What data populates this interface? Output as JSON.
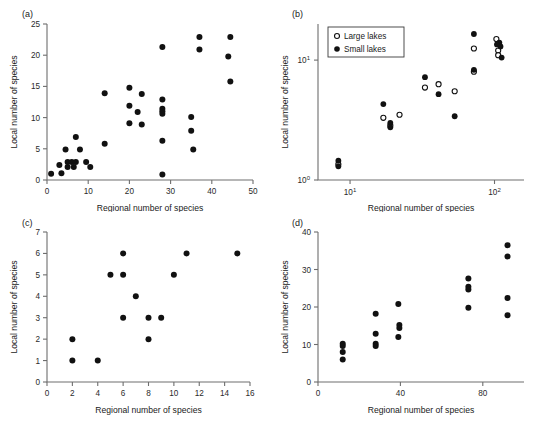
{
  "figure": {
    "axis_titles": {
      "x": "Regional number of species",
      "y": "Local number of species"
    }
  },
  "chart_data": [
    {
      "type": "scatter",
      "panel": "(a)",
      "title": "",
      "xlabel": "Regional number of species",
      "ylabel": "Local number of species",
      "xlim": [
        0,
        50
      ],
      "ylim": [
        0,
        25
      ],
      "xticks": [
        0,
        10,
        20,
        30,
        40,
        50
      ],
      "yticks": [
        0,
        5,
        10,
        15,
        20,
        25
      ],
      "xscale": "linear",
      "yscale": "linear",
      "grid": false,
      "legend": null,
      "series": [
        {
          "name": "sites",
          "marker": "filled-circle",
          "color": "#111111",
          "points": [
            [
              1,
              1
            ],
            [
              3,
              2.4
            ],
            [
              3.5,
              1.1
            ],
            [
              4.5,
              4.9
            ],
            [
              5,
              2.9
            ],
            [
              5,
              2.1
            ],
            [
              6,
              2.9
            ],
            [
              6.5,
              2.1
            ],
            [
              7,
              6.9
            ],
            [
              7,
              2.9
            ],
            [
              8,
              4.9
            ],
            [
              9.5,
              2.9
            ],
            [
              10.5,
              2.1
            ],
            [
              14,
              13.9
            ],
            [
              14,
              5.8
            ],
            [
              20,
              14.8
            ],
            [
              20,
              11.9
            ],
            [
              20,
              9.1
            ],
            [
              22,
              10.9
            ],
            [
              23,
              13.8
            ],
            [
              23,
              8.9
            ],
            [
              28,
              21.3
            ],
            [
              28,
              12.9
            ],
            [
              28,
              11.4
            ],
            [
              28,
              11.0
            ],
            [
              28,
              10.6
            ],
            [
              28,
              6.3
            ],
            [
              28,
              0.9
            ],
            [
              35,
              10.1
            ],
            [
              35,
              7.9
            ],
            [
              35.5,
              4.9
            ],
            [
              37,
              22.9
            ],
            [
              37,
              20.9
            ],
            [
              44,
              19.8
            ],
            [
              44.5,
              22.9
            ],
            [
              44.5,
              15.8
            ]
          ]
        }
      ]
    },
    {
      "type": "scatter",
      "panel": "(b)",
      "title": "",
      "xlabel": "Regional number of species",
      "ylabel": "Local number of species",
      "xlim": [
        6,
        160
      ],
      "ylim": [
        1,
        20
      ],
      "xticks": [
        10,
        100
      ],
      "xtick_labels": [
        "10",
        "100"
      ],
      "yticks": [
        1,
        10
      ],
      "ytick_labels": [
        "1",
        "10"
      ],
      "xscale": "log",
      "yscale": "log",
      "grid": false,
      "legend": {
        "position": "top-left",
        "entries": [
          "Large lakes",
          "Small lakes"
        ]
      },
      "series": [
        {
          "name": "Large lakes",
          "marker": "open-circle",
          "color": "#ffffff",
          "points": [
            [
              8.3,
              1.35
            ],
            [
              17,
              3.3
            ],
            [
              19,
              2.85
            ],
            [
              22,
              3.5
            ],
            [
              33,
              5.9
            ],
            [
              41,
              6.3
            ],
            [
              53,
              5.5
            ],
            [
              72,
              12.5
            ],
            [
              72,
              8.0
            ],
            [
              103,
              15.0
            ],
            [
              106,
              12.0
            ],
            [
              106,
              11.0
            ]
          ]
        },
        {
          "name": "Small lakes",
          "marker": "filled-circle",
          "color": "#111111",
          "points": [
            [
              8.3,
              1.45
            ],
            [
              8.3,
              1.3
            ],
            [
              17,
              4.3
            ],
            [
              19,
              3.0
            ],
            [
              19,
              2.75
            ],
            [
              33,
              7.2
            ],
            [
              41,
              5.2
            ],
            [
              53,
              3.4
            ],
            [
              72,
              16.5
            ],
            [
              72,
              8.3
            ],
            [
              108,
              14.0
            ],
            [
              110,
              13.0
            ],
            [
              112,
              10.5
            ],
            [
              104,
              13.5
            ]
          ]
        }
      ]
    },
    {
      "type": "scatter",
      "panel": "(c)",
      "title": "",
      "xlabel": "Regional number of species",
      "ylabel": "Local number of species",
      "xlim": [
        0,
        16
      ],
      "ylim": [
        0,
        7
      ],
      "xticks": [
        0,
        2,
        4,
        6,
        8,
        10,
        12,
        14,
        16
      ],
      "yticks": [
        0,
        1,
        2,
        3,
        4,
        5,
        6,
        7
      ],
      "xscale": "linear",
      "yscale": "linear",
      "grid": false,
      "legend": null,
      "series": [
        {
          "name": "sites",
          "marker": "filled-circle",
          "color": "#111111",
          "points": [
            [
              2,
              2
            ],
            [
              2,
              1
            ],
            [
              4,
              1
            ],
            [
              5,
              5
            ],
            [
              6,
              6
            ],
            [
              6,
              5
            ],
            [
              6,
              3
            ],
            [
              7,
              4
            ],
            [
              8,
              3
            ],
            [
              8,
              2
            ],
            [
              9,
              3
            ],
            [
              10,
              5
            ],
            [
              11,
              6
            ],
            [
              15,
              6
            ]
          ]
        }
      ]
    },
    {
      "type": "scatter",
      "panel": "(d)",
      "title": "",
      "xlabel": "Regional number of species",
      "ylabel": "Local number of species",
      "xlim": [
        0,
        100
      ],
      "ylim": [
        0,
        40
      ],
      "xticks": [
        0,
        40,
        80
      ],
      "yticks": [
        0,
        10,
        20,
        30,
        40
      ],
      "xscale": "linear",
      "yscale": "linear",
      "grid": false,
      "legend": null,
      "series": [
        {
          "name": "sites",
          "marker": "filled-circle",
          "color": "#111111",
          "points": [
            [
              12,
              10.2
            ],
            [
              12,
              9.6
            ],
            [
              12,
              8.0
            ],
            [
              12,
              6.0
            ],
            [
              28,
              18.2
            ],
            [
              28,
              12.9
            ],
            [
              28,
              10.2
            ],
            [
              28,
              9.6
            ],
            [
              39,
              20.8
            ],
            [
              39.5,
              15.2
            ],
            [
              39.5,
              14.4
            ],
            [
              39,
              12.0
            ],
            [
              73,
              27.6
            ],
            [
              73,
              25.4
            ],
            [
              73,
              24.7
            ],
            [
              73,
              19.8
            ],
            [
              92,
              36.5
            ],
            [
              92,
              33.5
            ],
            [
              92,
              22.4
            ],
            [
              92,
              17.8
            ]
          ]
        }
      ]
    }
  ]
}
